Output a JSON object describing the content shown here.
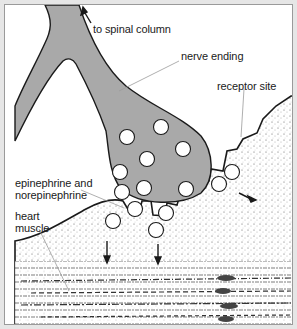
{
  "diagram": {
    "type": "neuromuscular-synapse",
    "labels": {
      "spinal": "to spinal column",
      "nerve": "nerve ending",
      "receptor": "receptor site",
      "transmitter_line1": "epinephrine and",
      "transmitter_line2": "norepinephrine",
      "muscle_line1": "heart",
      "muscle_line2": "muscle"
    },
    "colors": {
      "nerve_fill": "#a9a9a9",
      "outline": "#1a1a1a",
      "background": "#ffffff",
      "frame": "#e6e6e6",
      "leader_line": "#9a9a9a"
    }
  }
}
